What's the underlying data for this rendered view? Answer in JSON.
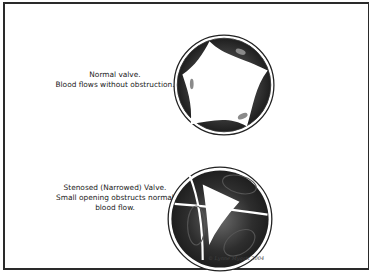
{
  "figure": {
    "normal_valve": {
      "caption_line1": "Normal valve.",
      "caption_line2": "Blood flows without obstruction."
    },
    "stenosed_valve": {
      "caption_line1": "Stenosed (Narrowed) Valve.",
      "caption_line2": "Small opening obstructs normal",
      "caption_line3": "blood flow."
    },
    "signature": "© Lynne Mygatt 2004"
  },
  "colors": {
    "frame": "#2a2a2a",
    "leaflet_dark": "#2b2b2b",
    "leaflet_mid": "#6a6a6a",
    "background": "#ffffff"
  }
}
